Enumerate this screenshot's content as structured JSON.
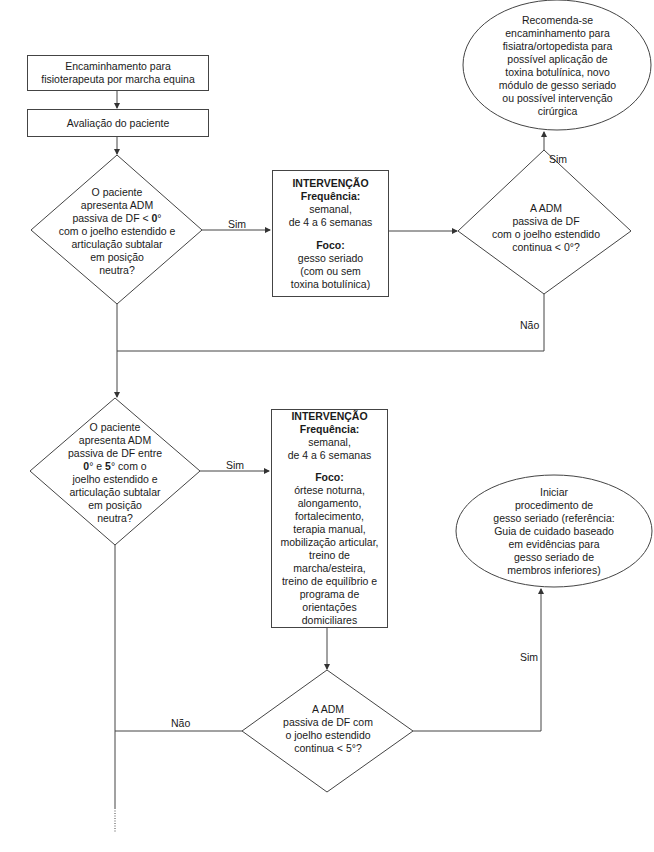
{
  "diagram": {
    "type": "flowchart",
    "nodes": {
      "start": {
        "shape": "rectangle",
        "lines": [
          "Encaminhamento para",
          "fisioterapeuta por marcha equina"
        ]
      },
      "evaluation": {
        "shape": "rectangle",
        "text": "Avaliação do paciente"
      },
      "decision1": {
        "shape": "diamond",
        "lines": [
          "O paciente",
          "apresenta ADM",
          "passiva de DF < ",
          "0",
          "°",
          "com o joelho estendido e",
          "articulação subtalar",
          "em posição",
          "neutra?"
        ]
      },
      "intervention1": {
        "shape": "rectangle",
        "title": "INTERVENÇÃO",
        "freq_label": "Frequência:",
        "freq_lines": [
          "semanal,",
          "de 4 a 6 semanas"
        ],
        "focus_label": "Foco:",
        "focus_lines": [
          "gesso seriado",
          "(com ou sem",
          "toxina botulínica)"
        ]
      },
      "decision2": {
        "shape": "diamond",
        "lines": [
          "A ADM",
          "passiva de DF",
          "com o joelho estendido",
          "continua < 0°?"
        ]
      },
      "outcome1": {
        "shape": "ellipse",
        "lines": [
          "Recomenda-se",
          "encaminhamento para",
          "fisiatra/ortopedista para",
          "possível aplicação de",
          "toxina botulínica, novo",
          "módulo de gesso seriado",
          "ou possível intervenção",
          "cirúrgica"
        ]
      },
      "decision3": {
        "shape": "diamond",
        "lines": [
          "O paciente",
          "apresenta ADM",
          "passiva de DF entre",
          "0",
          "° e ",
          "5",
          "° com o",
          "joelho estendido e",
          "articulação subtalar",
          "em posição",
          "neutra?"
        ]
      },
      "intervention2": {
        "shape": "rectangle",
        "title": "INTERVENÇÃO",
        "freq_label": "Frequência:",
        "freq_lines": [
          "semanal,",
          "de 4 a 6 semanas"
        ],
        "focus_label": "Foco:",
        "focus_lines": [
          "órtese noturna,",
          "alongamento,",
          "fortalecimento,",
          "terapia manual,",
          "mobilização articular,",
          "treino de",
          "marcha/esteira,",
          "treino de equilíbrio e",
          "programa de",
          "orientações",
          "domiciliares"
        ]
      },
      "decision4": {
        "shape": "diamond",
        "lines": [
          "A ADM",
          "passiva de DF com",
          "o joelho estendido",
          "continua < 5°?"
        ]
      },
      "outcome2": {
        "shape": "ellipse",
        "lines": [
          "Iniciar",
          "procedimento de",
          "gesso seriado (referência:",
          "Guia de cuidado baseado",
          "em evidências para",
          "gesso seriado de",
          "membros inferiores)"
        ]
      }
    },
    "edge_labels": {
      "d1_yes": "Sim",
      "d2_yes": "Sim",
      "d2_no": "Não",
      "d3_yes": "Sim",
      "d4_yes": "Sim",
      "d4_no": "Não"
    },
    "edges": [
      [
        "start",
        "evaluation",
        ""
      ],
      [
        "evaluation",
        "decision1",
        ""
      ],
      [
        "decision1",
        "intervention1",
        "Sim"
      ],
      [
        "intervention1",
        "decision2",
        ""
      ],
      [
        "decision2",
        "outcome1",
        "Sim"
      ],
      [
        "decision2",
        "decision3",
        "Não"
      ],
      [
        "decision1",
        "decision3",
        ""
      ],
      [
        "decision3",
        "intervention2",
        "Sim"
      ],
      [
        "intervention2",
        "decision4",
        ""
      ],
      [
        "decision4",
        "outcome2",
        "Sim"
      ],
      [
        "decision4",
        "continuation",
        "Não"
      ]
    ],
    "colors": {
      "line": "#444444",
      "text": "#1a1a1a",
      "background": "#ffffff"
    }
  }
}
